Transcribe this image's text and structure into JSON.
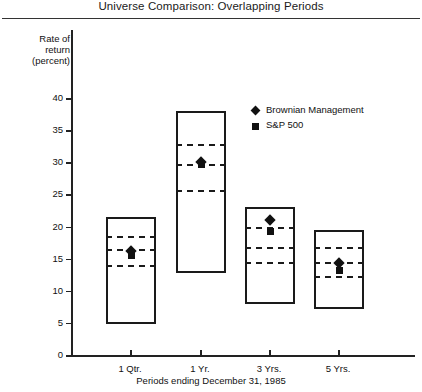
{
  "chart_data": {
    "type": "box",
    "title": "Universe Comparison: Overlapping Periods",
    "xlabel": "Periods ending December 31, 1985",
    "ylabel_lines": [
      "Rate of",
      "return",
      "(percent)"
    ],
    "ylim": [
      0,
      42
    ],
    "yticks": [
      0,
      5,
      10,
      15,
      20,
      25,
      30,
      35,
      40
    ],
    "ytick_labels": [
      "0",
      "5",
      "10",
      "15",
      "20",
      "25",
      "30",
      "35",
      "40"
    ],
    "categories": [
      "1 Qtr.",
      "1 Yr.",
      "3 Yrs.",
      "5 Yrs."
    ],
    "grid": false,
    "legend_position": "upper-right",
    "legend": [
      {
        "name": "Brownian Management",
        "marker": "diamond"
      },
      {
        "name": "S&P 500",
        "marker": "square"
      }
    ],
    "boxes": [
      {
        "category": "1 Qtr.",
        "top": 21.5,
        "bottom": 4.8,
        "quartiles": [
          18.5,
          16.5,
          14.0
        ]
      },
      {
        "category": "1 Yr.",
        "top": 38.0,
        "bottom": 12.7,
        "quartiles": [
          32.8,
          29.8,
          25.7
        ]
      },
      {
        "category": "3 Yrs.",
        "top": 23.0,
        "bottom": 8.0,
        "quartiles": [
          20.0,
          16.8,
          14.5
        ]
      },
      {
        "category": "5 Yrs.",
        "top": 19.5,
        "bottom": 7.2,
        "quartiles": [
          16.8,
          14.5,
          12.3
        ]
      }
    ],
    "series": [
      {
        "name": "Brownian Management",
        "marker": "diamond",
        "values": [
          16.2,
          30.0,
          21.0,
          14.3
        ]
      },
      {
        "name": "S&P 500",
        "marker": "square",
        "values": [
          15.5,
          29.6,
          19.2,
          13.2
        ]
      }
    ]
  }
}
